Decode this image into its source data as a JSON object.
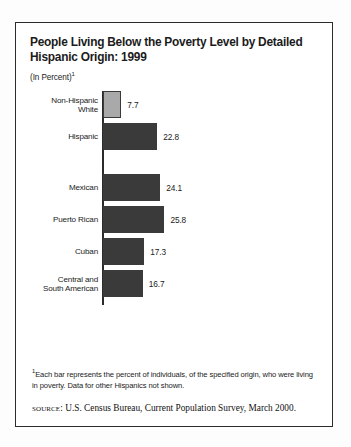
{
  "figure": {
    "title": "People Living Below the Poverty Level by Detailed\nHispanic Origin: 1999",
    "subtitle": "(In Percent)",
    "subtitle_footnote_marker": "1",
    "footnote_marker": "1",
    "footnote": "Each bar represents the percent of individuals, of the specified origin, who were living in poverty. Data for other Hispanics not shown.",
    "source_label": "source:",
    "source_text": "U.S. Census Bureau, Current Population Survey, March 2000."
  },
  "colors": {
    "bar_dark": "#3a3a3a",
    "bar_light": "#a9a9a9",
    "border": "#2b2b2b",
    "text": "#1b1b1b",
    "background": "#ffffff"
  },
  "chart_data": {
    "type": "bar",
    "orientation": "horizontal",
    "title": "People Living Below the Poverty Level by Detailed Hispanic Origin: 1999",
    "subtitle": "(In Percent)",
    "xlabel": "",
    "ylabel": "",
    "xlim": [
      0,
      28
    ],
    "grid": false,
    "legend": false,
    "categories": [
      "Non-Hispanic White",
      "Hispanic",
      "Mexican",
      "Puerto Rican",
      "Cuban",
      "Central and South American"
    ],
    "values": [
      7.7,
      22.8,
      24.1,
      25.8,
      17.3,
      16.7
    ],
    "bars": [
      {
        "label": "Non-Hispanic\nWhite",
        "value": 7.7,
        "value_text": "7.7",
        "style": "light",
        "group": 1
      },
      {
        "label": "Hispanic",
        "value": 22.8,
        "value_text": "22.8",
        "style": "dark",
        "group": 1
      },
      {
        "label": "Mexican",
        "value": 24.1,
        "value_text": "24.1",
        "style": "dark",
        "group": 2
      },
      {
        "label": "Puerto Rican",
        "value": 25.8,
        "value_text": "25.8",
        "style": "dark",
        "group": 2
      },
      {
        "label": "Cuban",
        "value": 17.3,
        "value_text": "17.3",
        "style": "dark",
        "group": 2
      },
      {
        "label": "Central and\nSouth American",
        "value": 16.7,
        "value_text": "16.7",
        "style": "dark",
        "group": 2
      }
    ],
    "source": "U.S. Census Bureau, Current Population Survey, March 2000.",
    "note": "Each bar represents the percent of individuals, of the specified origin, who were living in poverty. Data for other Hispanics not shown."
  }
}
